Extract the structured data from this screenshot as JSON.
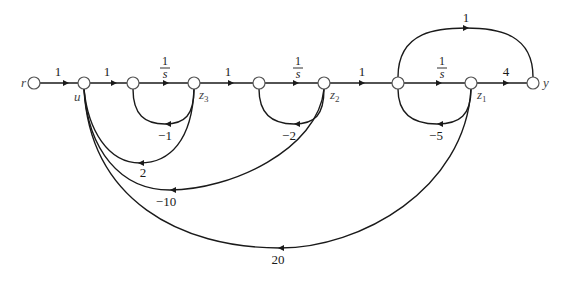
{
  "diagram": {
    "type": "signal-flow-graph",
    "nodes": [
      {
        "id": "r",
        "label": "r",
        "x": 34,
        "y": 83
      },
      {
        "id": "u",
        "label": "u",
        "x": 84,
        "y": 83
      },
      {
        "id": "n1",
        "label": "",
        "x": 133,
        "y": 83
      },
      {
        "id": "z3",
        "label": "z",
        "sub": "3",
        "x": 194,
        "y": 83
      },
      {
        "id": "n2",
        "label": "",
        "x": 259,
        "y": 83
      },
      {
        "id": "z2",
        "label": "z",
        "sub": "2",
        "x": 324,
        "y": 83
      },
      {
        "id": "n3",
        "label": "",
        "x": 398,
        "y": 83
      },
      {
        "id": "z1",
        "label": "z",
        "sub": "1",
        "x": 471,
        "y": 83
      },
      {
        "id": "y",
        "label": "y",
        "x": 533,
        "y": 83
      }
    ],
    "edges": [
      {
        "from": "r",
        "to": "u",
        "gain": "1"
      },
      {
        "from": "u",
        "to": "n1",
        "gain": "1"
      },
      {
        "from": "n1",
        "to": "z3",
        "gain": "1/s",
        "num": "1",
        "den": "s"
      },
      {
        "from": "z3",
        "to": "n1",
        "gain": "−1"
      },
      {
        "from": "z3",
        "to": "n2",
        "gain": "1"
      },
      {
        "from": "n2",
        "to": "z2",
        "gain": "1/s",
        "num": "1",
        "den": "s"
      },
      {
        "from": "z2",
        "to": "n2",
        "gain": "−2"
      },
      {
        "from": "z2",
        "to": "n3",
        "gain": "1"
      },
      {
        "from": "n3",
        "to": "z1",
        "gain": "1/s",
        "num": "1",
        "den": "s"
      },
      {
        "from": "z1",
        "to": "n3",
        "gain": "−5"
      },
      {
        "from": "z1",
        "to": "y",
        "gain": "4"
      },
      {
        "from": "n3",
        "to": "y",
        "gain": "1"
      },
      {
        "from": "z3",
        "to": "u",
        "gain": "2"
      },
      {
        "from": "z2",
        "to": "u",
        "gain": "−10"
      },
      {
        "from": "z1",
        "to": "u",
        "gain": "20"
      }
    ]
  },
  "labels": {
    "r": "r",
    "u": "u",
    "z": "z",
    "y": "y",
    "z3_sub": "3",
    "z2_sub": "2",
    "z1_sub": "1",
    "g_r_u": "1",
    "g_u_n1": "1",
    "g_n1_z3_num": "1",
    "g_n1_z3_den": "s",
    "g_z3_n2": "1",
    "g_n2_z2_num": "1",
    "g_n2_z2_den": "s",
    "g_z2_n3": "1",
    "g_n3_z1_num": "1",
    "g_n3_z1_den": "s",
    "g_z1_y": "4",
    "g_n3_y": "1",
    "g_loop1": "−1",
    "g_loop2": "−2",
    "g_loop3": "−5",
    "g_z3_u": "2",
    "g_z2_u": "−10",
    "g_z1_u": "20"
  }
}
